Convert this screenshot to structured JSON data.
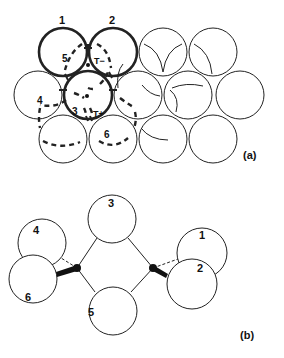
{
  "panel_a": {
    "label": "(a)",
    "circle_labels": {
      "c1": "1",
      "c2": "2",
      "c3": "3",
      "c4": "4",
      "c5": "5",
      "c6": "6"
    },
    "tetra_labels": {
      "minus": "T−",
      "plus": "T+"
    }
  },
  "panel_b": {
    "label": "(b)",
    "circle_labels": {
      "c1": "1",
      "c2": "2",
      "c3": "3",
      "c4": "4",
      "c5": "5",
      "c6": "6"
    }
  },
  "colors": {
    "stroke": "#1a1a1a",
    "background": "#ffffff"
  }
}
